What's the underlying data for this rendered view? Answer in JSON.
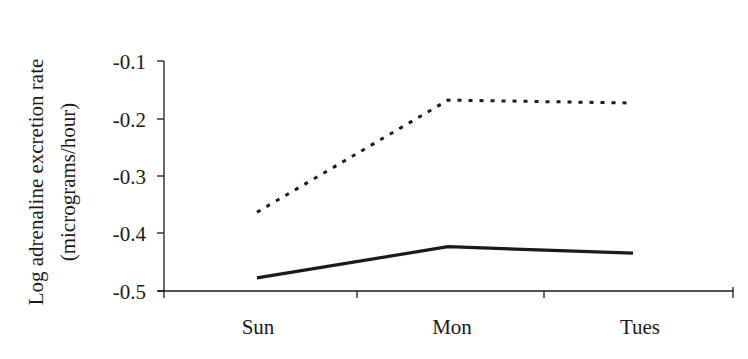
{
  "chart_data": {
    "type": "line",
    "title": "",
    "xlabel": "",
    "ylabel": "Log adrenaline excretion rate (micrograms/hour)",
    "ylabel_lines": [
      "Log adrenaline excretion rate",
      "(micrograms/hour)"
    ],
    "categories": [
      "Sun",
      "Mon",
      "Tues"
    ],
    "yticks": [
      "-0.1",
      "-0.2",
      "-0.3",
      "-0.4",
      "-0.5"
    ],
    "ylim": [
      -0.5,
      -0.1
    ],
    "grid": false,
    "legend": null,
    "series": [
      {
        "name": "dashed",
        "style": "dashed",
        "values": [
          -0.363,
          -0.168,
          -0.173
        ]
      },
      {
        "name": "solid",
        "style": "solid",
        "values": [
          -0.477,
          -0.423,
          -0.434
        ]
      }
    ]
  }
}
